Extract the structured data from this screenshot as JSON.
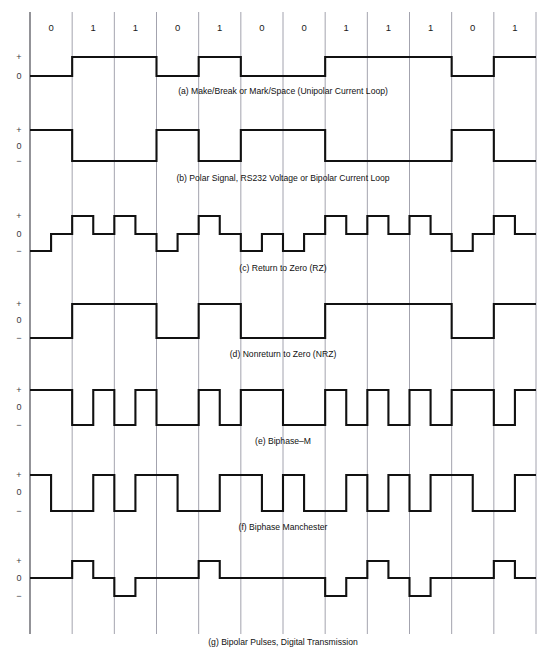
{
  "figure": {
    "bit_sequence": [
      0,
      1,
      1,
      0,
      1,
      0,
      0,
      1,
      1,
      1,
      0,
      1
    ],
    "bit_labels": [
      "0",
      "1",
      "1",
      "0",
      "1",
      "0",
      "0",
      "1",
      "1",
      "1",
      "0",
      "1"
    ],
    "axis_labels": {
      "plus": "+",
      "zero": "0",
      "minus": "−"
    },
    "colors": {
      "grid": "#8c8c99",
      "frame": "#3a3a42",
      "wave": "#111111",
      "text": "#111111",
      "background": "#ffffff"
    },
    "geometry": {
      "grid_left": 30,
      "grid_right": 536,
      "grid_top": 12,
      "grid_bottom": 634,
      "cells": 12
    },
    "panels": [
      {
        "id": "a",
        "caption": "(a)  Make/Break or Mark/Space (Unipolar Current Loop)",
        "encoding": "unipolar",
        "levels": [
          "+",
          "0"
        ],
        "has_minus": false,
        "top": 42,
        "plus_y": 57,
        "zero_y": 76,
        "minus_y": 76,
        "caption_y": 94
      },
      {
        "id": "b",
        "caption": "(b)  Polar Signal, RS232 Voltage or Bipolar Current Loop",
        "encoding": "polar-inverted",
        "levels": [
          "+",
          "0",
          "−"
        ],
        "has_minus": true,
        "top": 122,
        "plus_y": 130,
        "zero_y": 146,
        "minus_y": 161,
        "caption_y": 181
      },
      {
        "id": "c",
        "caption": "(c)  Return to Zero (RZ)",
        "encoding": "return-to-zero",
        "levels": [
          "+",
          "0",
          "−"
        ],
        "has_minus": true,
        "top": 208,
        "plus_y": 216,
        "zero_y": 234,
        "minus_y": 251,
        "caption_y": 271
      },
      {
        "id": "d",
        "caption": "(d)  Nonreturn to Zero (NRZ)",
        "encoding": "nrz",
        "levels": [
          "+",
          "0",
          "−"
        ],
        "has_minus": true,
        "top": 296,
        "plus_y": 304,
        "zero_y": 320,
        "minus_y": 338,
        "caption_y": 357
      },
      {
        "id": "e",
        "caption": "(e)  Biphase–M",
        "encoding": "biphase-m",
        "levels": [
          "+",
          "0",
          "−"
        ],
        "has_minus": true,
        "top": 382,
        "plus_y": 390,
        "zero_y": 407,
        "minus_y": 425,
        "caption_y": 444
      },
      {
        "id": "f",
        "caption": "(f)  Biphase Manchester",
        "encoding": "manchester",
        "levels": [
          "+",
          "0",
          "−"
        ],
        "has_minus": true,
        "top": 467,
        "plus_y": 475,
        "zero_y": 492,
        "minus_y": 511,
        "caption_y": 530
      },
      {
        "id": "g",
        "caption": "(g)  Bipolar Pulses, Digital Transmission",
        "encoding": "bipolar-ami",
        "levels": [
          "+",
          "0",
          "−"
        ],
        "has_minus": true,
        "top": 553,
        "plus_y": 561,
        "zero_y": 578,
        "minus_y": 596,
        "caption_y": 645
      }
    ],
    "bit_label_row": {
      "y": 31
    }
  }
}
